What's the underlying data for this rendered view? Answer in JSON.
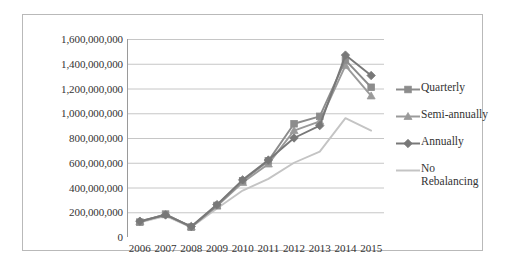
{
  "chart_data": {
    "type": "line",
    "title": "",
    "xlabel": "",
    "ylabel": "",
    "categories": [
      "2006",
      "2007",
      "2008",
      "2009",
      "2010",
      "2011",
      "2012",
      "2013",
      "2014",
      "2015"
    ],
    "ylim": [
      0,
      1600000000
    ],
    "ytick_values": [
      0,
      200000000,
      400000000,
      600000000,
      800000000,
      1000000000,
      1200000000,
      1400000000,
      1600000000
    ],
    "ytick_labels": [
      "0",
      "200,000,000",
      "400,000,000",
      "600,000,000",
      "800,000,000",
      "1,000,000,000",
      "1,200,000,000",
      "1,400,000,000",
      "1,600,000,000"
    ],
    "grid": true,
    "legend_position": "right",
    "series": [
      {
        "name": "Quarterly",
        "marker": "square",
        "color": "#8c8c8c",
        "values": [
          120000000,
          185000000,
          80000000,
          255000000,
          455000000,
          615000000,
          915000000,
          975000000,
          1430000000,
          1210000000
        ]
      },
      {
        "name": "Semi-annually",
        "marker": "triangle",
        "color": "#9a9a9a",
        "values": [
          125000000,
          180000000,
          82000000,
          250000000,
          440000000,
          590000000,
          860000000,
          935000000,
          1385000000,
          1140000000
        ]
      },
      {
        "name": "Annually",
        "marker": "diamond",
        "color": "#787878",
        "values": [
          128000000,
          178000000,
          85000000,
          262000000,
          462000000,
          622000000,
          800000000,
          900000000,
          1470000000,
          1305000000
        ]
      },
      {
        "name": "No\nRebalancing",
        "marker": "none",
        "color": "#c4c4c4",
        "values": [
          118000000,
          170000000,
          78000000,
          230000000,
          375000000,
          470000000,
          600000000,
          690000000,
          960000000,
          860000000
        ]
      }
    ]
  }
}
